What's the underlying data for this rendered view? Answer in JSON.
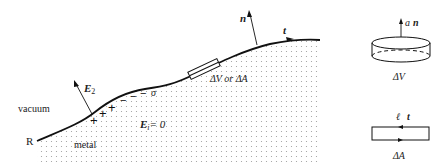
{
  "figure": {
    "labels": {
      "vacuum": "vacuum",
      "metal": "metal",
      "point_R": "R",
      "field_outside": "E",
      "field_outside_sub": "2",
      "field_inside": "E",
      "field_inside_sub": "i",
      "field_inside_value": "= 0",
      "surface_charge": "σ",
      "normal": "n",
      "tangent": "t",
      "region_label": "ΔV or ΔA"
    },
    "charges": {
      "plus": [
        "+",
        "+",
        "+"
      ],
      "minus": [
        "−",
        "−",
        "−"
      ]
    },
    "pillbox": {
      "normal_label_a": "a",
      "normal_label_n": "n",
      "caption": "ΔV"
    },
    "loop": {
      "label_l": "ℓ",
      "label_t": "t",
      "caption": "ΔA"
    },
    "colors": {
      "line": "#111111",
      "dots": "#9a9a9a",
      "background": "#ffffff"
    }
  }
}
